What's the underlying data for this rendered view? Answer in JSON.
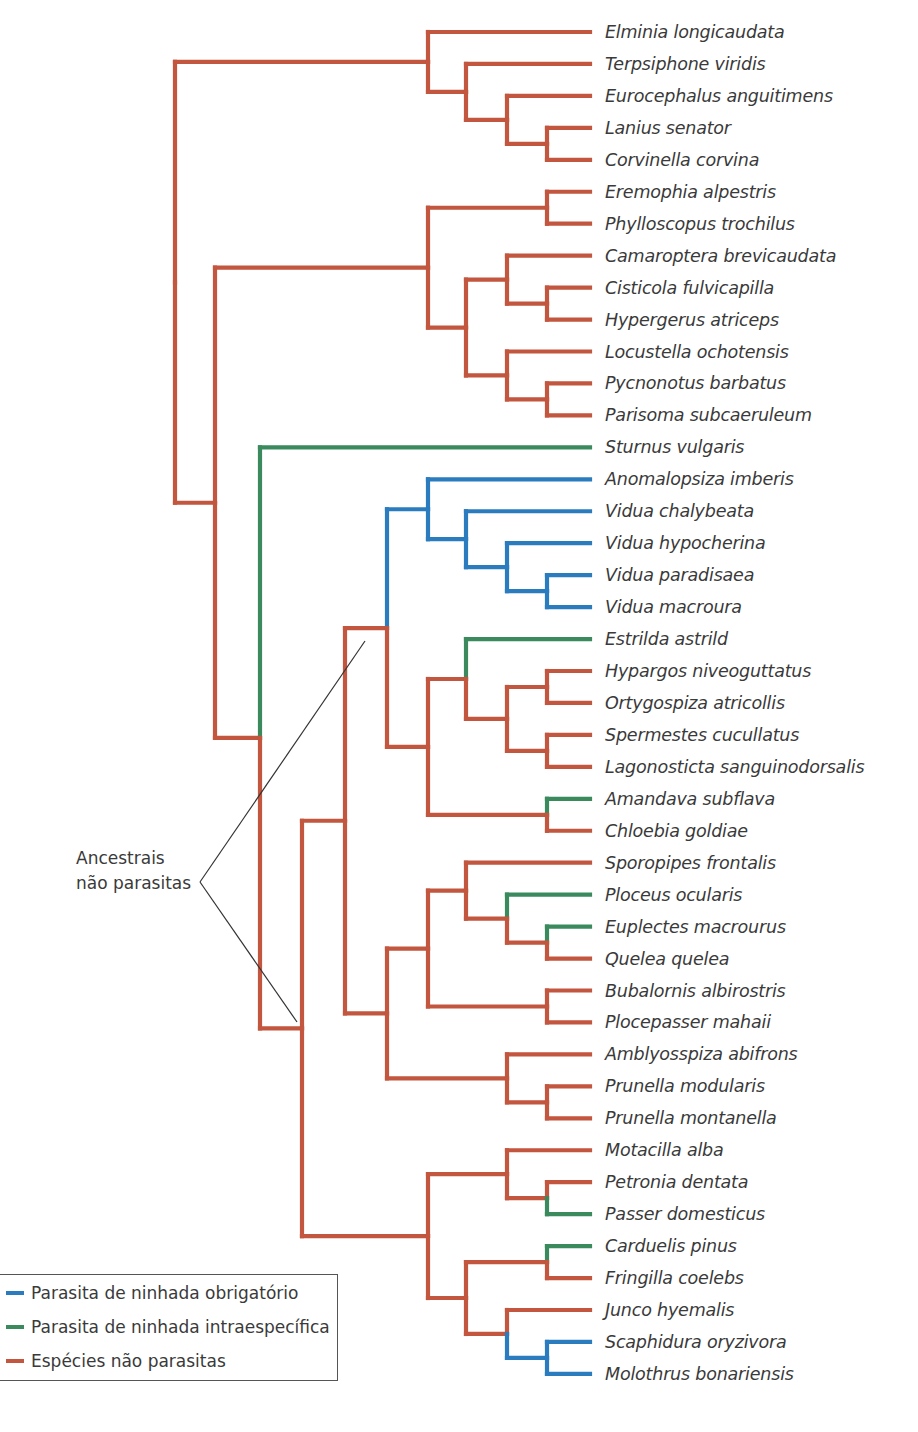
{
  "colors": {
    "obligate": "#2b7bbf",
    "intraspecific": "#3a8a5e",
    "nonparasite": "#c2563e",
    "pointer": "#333333"
  },
  "legend": {
    "items": [
      {
        "key": "obligate",
        "label": "Parasita de ninhada obrigatório"
      },
      {
        "key": "intraspecific",
        "label": "Parasita de ninhada intraespecífica"
      },
      {
        "key": "nonparasite",
        "label": "Espécies não parasitas"
      }
    ]
  },
  "annotation": {
    "line1": "Ancestrais",
    "line2": "não parasitas"
  },
  "species": [
    {
      "name": "Elminia longicaudata",
      "status": "nonparasite"
    },
    {
      "name": "Terpsiphone viridis",
      "status": "nonparasite"
    },
    {
      "name": "Eurocephalus anguitimens",
      "status": "nonparasite"
    },
    {
      "name": "Lanius senator",
      "status": "nonparasite"
    },
    {
      "name": "Corvinella corvina",
      "status": "nonparasite"
    },
    {
      "name": "Eremophia alpestris",
      "status": "nonparasite"
    },
    {
      "name": "Phylloscopus trochilus",
      "status": "nonparasite"
    },
    {
      "name": "Camaroptera brevicaudata",
      "status": "nonparasite"
    },
    {
      "name": "Cisticola fulvicapilla",
      "status": "nonparasite"
    },
    {
      "name": "Hypergerus atriceps",
      "status": "nonparasite"
    },
    {
      "name": "Locustella ochotensis",
      "status": "nonparasite"
    },
    {
      "name": "Pycnonotus barbatus",
      "status": "nonparasite"
    },
    {
      "name": "Parisoma subcaeruleum",
      "status": "nonparasite"
    },
    {
      "name": "Sturnus vulgaris",
      "status": "intraspecific"
    },
    {
      "name": "Anomalopsiza imberis",
      "status": "obligate"
    },
    {
      "name": "Vidua chalybeata",
      "status": "obligate"
    },
    {
      "name": "Vidua hypocherina",
      "status": "obligate"
    },
    {
      "name": "Vidua paradisaea",
      "status": "obligate"
    },
    {
      "name": "Vidua macroura",
      "status": "obligate"
    },
    {
      "name": "Estrilda astrild",
      "status": "intraspecific"
    },
    {
      "name": "Hypargos niveoguttatus",
      "status": "nonparasite"
    },
    {
      "name": "Ortygospiza atricollis",
      "status": "nonparasite"
    },
    {
      "name": "Spermestes cucullatus",
      "status": "nonparasite"
    },
    {
      "name": "Lagonosticta sanguinodorsalis",
      "status": "nonparasite"
    },
    {
      "name": "Amandava subflava",
      "status": "intraspecific"
    },
    {
      "name": "Chloebia goldiae",
      "status": "nonparasite"
    },
    {
      "name": "Sporopipes frontalis",
      "status": "nonparasite"
    },
    {
      "name": "Ploceus ocularis",
      "status": "intraspecific"
    },
    {
      "name": "Euplectes macrourus",
      "status": "intraspecific"
    },
    {
      "name": "Quelea quelea",
      "status": "nonparasite"
    },
    {
      "name": "Bubalornis albirostris",
      "status": "nonparasite"
    },
    {
      "name": "Plocepasser mahaii",
      "status": "nonparasite"
    },
    {
      "name": "Amblyosspiza abifrons",
      "status": "nonparasite"
    },
    {
      "name": "Prunella modularis",
      "status": "nonparasite"
    },
    {
      "name": "Prunella montanella",
      "status": "nonparasite"
    },
    {
      "name": "Motacilla alba",
      "status": "nonparasite"
    },
    {
      "name": "Petronia dentata",
      "status": "nonparasite"
    },
    {
      "name": "Passer domesticus",
      "status": "intraspecific"
    },
    {
      "name": "Carduelis pinus",
      "status": "intraspecific"
    },
    {
      "name": "Fringilla coelebs",
      "status": "nonparasite"
    },
    {
      "name": "Junco hyemalis",
      "status": "nonparasite"
    },
    {
      "name": "Scaphidura oryzivora",
      "status": "obligate"
    },
    {
      "name": "Molothrus bonariensis",
      "status": "obligate"
    }
  ],
  "layout": {
    "leaf_top": 32,
    "leaf_step": 31.95,
    "leaf_x": 590
  },
  "tree": {
    "x": 175,
    "c": "nonparasite",
    "children": [
      {
        "x": 428,
        "c": "nonparasite",
        "children": [
          {
            "leaf": 0,
            "c": "nonparasite"
          },
          {
            "x": 466,
            "c": "nonparasite",
            "children": [
              {
                "leaf": 1,
                "c": "nonparasite"
              },
              {
                "x": 507,
                "c": "nonparasite",
                "children": [
                  {
                    "leaf": 2,
                    "c": "nonparasite"
                  },
                  {
                    "x": 547,
                    "c": "nonparasite",
                    "children": [
                      {
                        "leaf": 3,
                        "c": "nonparasite"
                      },
                      {
                        "leaf": 4,
                        "c": "nonparasite"
                      }
                    ]
                  }
                ]
              }
            ]
          }
        ]
      },
      {
        "x": 215,
        "c": "nonparasite",
        "children": [
          {
            "x": 428,
            "c": "nonparasite",
            "children": [
              {
                "x": 547,
                "c": "nonparasite",
                "children": [
                  {
                    "leaf": 5,
                    "c": "nonparasite"
                  },
                  {
                    "leaf": 6,
                    "c": "nonparasite"
                  }
                ]
              },
              {
                "x": 466,
                "c": "nonparasite",
                "children": [
                  {
                    "x": 507,
                    "c": "nonparasite",
                    "children": [
                      {
                        "leaf": 7,
                        "c": "nonparasite"
                      },
                      {
                        "x": 547,
                        "c": "nonparasite",
                        "children": [
                          {
                            "leaf": 8,
                            "c": "nonparasite"
                          },
                          {
                            "leaf": 9,
                            "c": "nonparasite"
                          }
                        ]
                      }
                    ]
                  },
                  {
                    "x": 507,
                    "c": "nonparasite",
                    "children": [
                      {
                        "leaf": 10,
                        "c": "nonparasite"
                      },
                      {
                        "x": 547,
                        "c": "nonparasite",
                        "children": [
                          {
                            "leaf": 11,
                            "c": "nonparasite"
                          },
                          {
                            "leaf": 12,
                            "c": "nonparasite"
                          }
                        ]
                      }
                    ]
                  }
                ]
              }
            ]
          },
          {
            "x": 260,
            "c": "nonparasite",
            "children": [
              {
                "leaf": 13,
                "c": "intraspecific"
              },
              {
                "x": 302,
                "c": "nonparasite",
                "children": [
                  {
                    "x": 345,
                    "c": "nonparasite",
                    "children": [
                      {
                        "x": 387,
                        "c": "nonparasite",
                        "children": [
                          {
                            "x": 428,
                            "c": "obligate",
                            "children": [
                              {
                                "leaf": 14,
                                "c": "obligate"
                              },
                              {
                                "x": 466,
                                "c": "obligate",
                                "children": [
                                  {
                                    "leaf": 15,
                                    "c": "obligate"
                                  },
                                  {
                                    "x": 507,
                                    "c": "obligate",
                                    "children": [
                                      {
                                        "leaf": 16,
                                        "c": "obligate"
                                      },
                                      {
                                        "x": 547,
                                        "c": "obligate",
                                        "children": [
                                          {
                                            "leaf": 17,
                                            "c": "obligate"
                                          },
                                          {
                                            "leaf": 18,
                                            "c": "obligate"
                                          }
                                        ]
                                      }
                                    ]
                                  }
                                ]
                              }
                            ]
                          },
                          {
                            "x": 428,
                            "c": "nonparasite",
                            "children": [
                              {
                                "x": 466,
                                "c": "nonparasite",
                                "children": [
                                  {
                                    "leaf": 19,
                                    "c": "intraspecific"
                                  },
                                  {
                                    "x": 507,
                                    "c": "nonparasite",
                                    "children": [
                                      {
                                        "x": 547,
                                        "c": "nonparasite",
                                        "children": [
                                          {
                                            "leaf": 20,
                                            "c": "nonparasite"
                                          },
                                          {
                                            "leaf": 21,
                                            "c": "nonparasite"
                                          }
                                        ]
                                      },
                                      {
                                        "x": 547,
                                        "c": "nonparasite",
                                        "children": [
                                          {
                                            "leaf": 22,
                                            "c": "nonparasite"
                                          },
                                          {
                                            "leaf": 23,
                                            "c": "nonparasite"
                                          }
                                        ]
                                      }
                                    ]
                                  }
                                ]
                              },
                              {
                                "x": 547,
                                "c": "nonparasite",
                                "children": [
                                  {
                                    "leaf": 24,
                                    "c": "intraspecific"
                                  },
                                  {
                                    "leaf": 25,
                                    "c": "nonparasite"
                                  }
                                ]
                              }
                            ]
                          }
                        ]
                      },
                      {
                        "x": 387,
                        "c": "nonparasite",
                        "children": [
                          {
                            "x": 428,
                            "c": "nonparasite",
                            "children": [
                              {
                                "x": 466,
                                "c": "nonparasite",
                                "children": [
                                  {
                                    "leaf": 26,
                                    "c": "nonparasite"
                                  },
                                  {
                                    "x": 507,
                                    "c": "nonparasite",
                                    "children": [
                                      {
                                        "leaf": 27,
                                        "c": "intraspecific"
                                      },
                                      {
                                        "x": 547,
                                        "c": "nonparasite",
                                        "children": [
                                          {
                                            "leaf": 28,
                                            "c": "intraspecific"
                                          },
                                          {
                                            "leaf": 29,
                                            "c": "nonparasite"
                                          }
                                        ]
                                      }
                                    ]
                                  }
                                ]
                              },
                              {
                                "x": 547,
                                "c": "nonparasite",
                                "children": [
                                  {
                                    "leaf": 30,
                                    "c": "nonparasite"
                                  },
                                  {
                                    "leaf": 31,
                                    "c": "nonparasite"
                                  }
                                ]
                              }
                            ]
                          },
                          {
                            "x": 507,
                            "c": "nonparasite",
                            "children": [
                              {
                                "leaf": 32,
                                "c": "nonparasite"
                              },
                              {
                                "x": 547,
                                "c": "nonparasite",
                                "children": [
                                  {
                                    "leaf": 33,
                                    "c": "nonparasite"
                                  },
                                  {
                                    "leaf": 34,
                                    "c": "nonparasite"
                                  }
                                ]
                              }
                            ]
                          }
                        ]
                      }
                    ]
                  },
                  {
                    "x": 428,
                    "c": "nonparasite",
                    "children": [
                      {
                        "x": 507,
                        "c": "nonparasite",
                        "children": [
                          {
                            "leaf": 35,
                            "c": "nonparasite"
                          },
                          {
                            "x": 547,
                            "c": "nonparasite",
                            "children": [
                              {
                                "leaf": 36,
                                "c": "nonparasite"
                              },
                              {
                                "leaf": 37,
                                "c": "intraspecific"
                              }
                            ]
                          }
                        ]
                      },
                      {
                        "x": 466,
                        "c": "nonparasite",
                        "children": [
                          {
                            "x": 547,
                            "c": "nonparasite",
                            "children": [
                              {
                                "leaf": 38,
                                "c": "intraspecific"
                              },
                              {
                                "leaf": 39,
                                "c": "nonparasite"
                              }
                            ]
                          },
                          {
                            "x": 507,
                            "c": "nonparasite",
                            "children": [
                              {
                                "leaf": 40,
                                "c": "nonparasite"
                              },
                              {
                                "x": 547,
                                "c": "obligate",
                                "children": [
                                  {
                                    "leaf": 41,
                                    "c": "obligate"
                                  },
                                  {
                                    "leaf": 42,
                                    "c": "obligate"
                                  }
                                ]
                              }
                            ]
                          }
                        ]
                      }
                    ]
                  }
                ]
              }
            ]
          }
        ]
      }
    ]
  }
}
